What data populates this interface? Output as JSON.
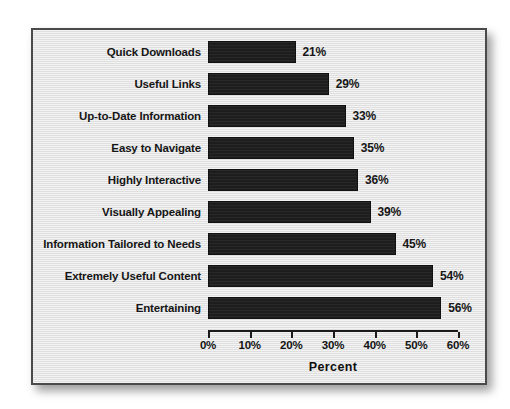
{
  "figure": {
    "background_color": "#e4e4e4",
    "border_color": "#4a4a4a",
    "bar_color": "#1d1d1d",
    "text_color": "#161616"
  },
  "chart_data": {
    "type": "bar",
    "orientation": "horizontal",
    "title": "",
    "xlabel": "Percent",
    "ylabel": "",
    "xlim": [
      0,
      60
    ],
    "grid": false,
    "legend": null,
    "xticks": [
      "0%",
      "10%",
      "20%",
      "30%",
      "40%",
      "50%",
      "60%"
    ],
    "xtick_values": [
      0,
      10,
      20,
      30,
      40,
      50,
      60
    ],
    "categories": [
      "Quick Downloads",
      "Useful Links",
      "Up-to-Date Information",
      "Easy to Navigate",
      "Highly Interactive",
      "Visually Appealing",
      "Information Tailored to Needs",
      "Extremely Useful Content",
      "Entertaining"
    ],
    "values": [
      21,
      29,
      33,
      35,
      36,
      39,
      45,
      54,
      56
    ],
    "data_labels": [
      "21%",
      "29%",
      "33%",
      "35%",
      "36%",
      "39%",
      "45%",
      "54%",
      "56%"
    ]
  }
}
